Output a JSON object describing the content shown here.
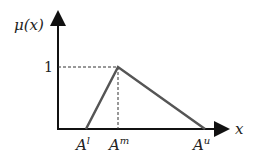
{
  "diagram": {
    "y_axis_label": "μ(x)",
    "x_axis_label": "x",
    "y_tick": "1",
    "points": [
      {
        "name": "A",
        "sup": "l",
        "x": 86,
        "mu": 0
      },
      {
        "name": "A",
        "sup": "m",
        "x": 118,
        "mu": 1
      },
      {
        "name": "A",
        "sup": "u",
        "x": 205,
        "mu": 0
      }
    ],
    "colors": {
      "axis": "#111111",
      "triangle": "#555555",
      "dashed": "#333333"
    }
  }
}
